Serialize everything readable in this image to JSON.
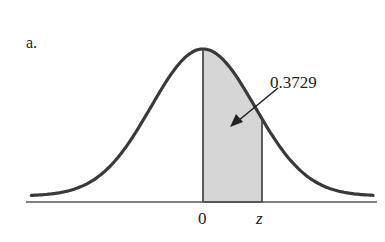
{
  "figure": {
    "panel_label": "a.",
    "area_label": "0.3729",
    "x_ticks": [
      {
        "label": "0",
        "value": 0
      },
      {
        "label": "z",
        "value": 0.33
      }
    ],
    "colors": {
      "curve": "#3a3a3a",
      "shade": "#d6d6d6",
      "axis": "#555555",
      "text": "#222222"
    }
  },
  "chart_data": {
    "type": "area",
    "title": "a.",
    "x_range": [
      -3.3,
      3.3
    ],
    "shaded_interval": {
      "from": "0",
      "to": "z"
    },
    "shaded_area": 0.3729,
    "annotation": "0.3729",
    "tick_labels": [
      "0",
      "z"
    ],
    "xlabel": "",
    "ylabel": "",
    "grid": false
  }
}
